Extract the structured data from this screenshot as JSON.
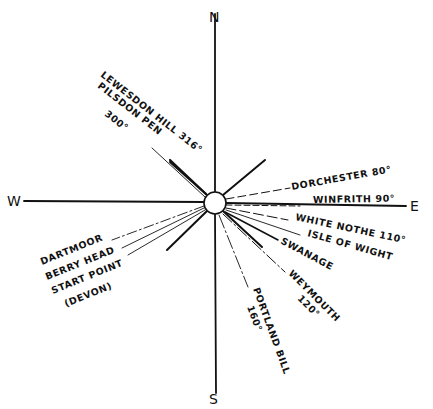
{
  "diagram": {
    "type": "compass-bearing-sketch",
    "center": {
      "x": 215,
      "y": 203,
      "radius": 11
    },
    "cardinals": {
      "north": "N",
      "south": "S",
      "east": "E",
      "west": "W"
    },
    "bearings": [
      {
        "id": "lewesdon",
        "label": "LEWESDON HILL 316°",
        "bearing": 316
      },
      {
        "id": "pilsdon",
        "label": "PILSDON PEN",
        "bearing": null
      },
      {
        "id": "pilsdon-deg",
        "label": "300°",
        "bearing": 300
      },
      {
        "id": "dorchester",
        "label": "DORCHESTER 80°",
        "bearing": 80
      },
      {
        "id": "winfrith",
        "label": "WINFRITH 90°",
        "bearing": 90
      },
      {
        "id": "white-nothe",
        "label": "WHITE NOTHE 110°",
        "bearing": 110
      },
      {
        "id": "isle-of-wight",
        "label": "ISLE OF WIGHT",
        "bearing": null
      },
      {
        "id": "swanage",
        "label": "SWANAGE",
        "bearing": null
      },
      {
        "id": "weymouth",
        "label": "WEYMOUTH",
        "bearing": null
      },
      {
        "id": "weymouth-deg",
        "label": "120°",
        "bearing": 120
      },
      {
        "id": "portland",
        "label": "PORTLAND BILL",
        "bearing": null
      },
      {
        "id": "portland-deg",
        "label": "160°",
        "bearing": 160
      },
      {
        "id": "dartmoor",
        "label": "DARTMOOR",
        "bearing": null
      },
      {
        "id": "berry-head",
        "label": "BERRY HEAD",
        "bearing": null
      },
      {
        "id": "start-point",
        "label": "START POINT",
        "bearing": null
      },
      {
        "id": "devon",
        "label": "(DEVON)",
        "bearing": null
      }
    ],
    "colors": {
      "ink": "#111111",
      "paper": "#ffffff"
    }
  }
}
